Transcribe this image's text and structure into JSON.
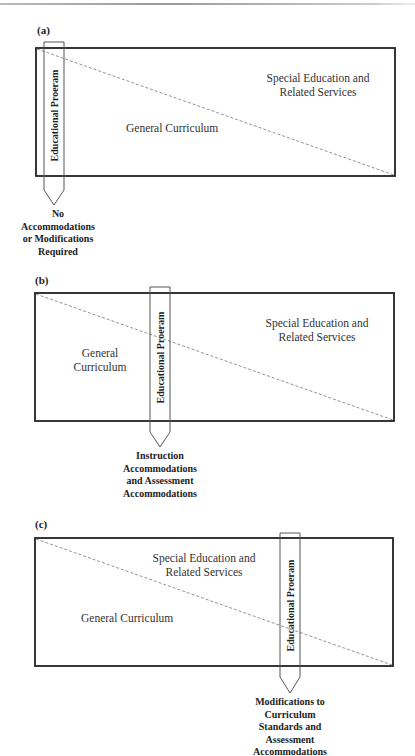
{
  "header": {
    "rule": true
  },
  "panels": [
    {
      "label": "(a)",
      "box": {
        "x": 36,
        "y": 48,
        "w": 359,
        "h": 128
      },
      "pencil": {
        "x": 44,
        "w": 20,
        "top": 42,
        "shaft_end": 190,
        "tip": 205
      },
      "pencil_label": "Educational Proeram",
      "regions": {
        "general": "General Curriculum",
        "special_line1": "Special Education and",
        "special_line2": "Related Services"
      },
      "callout": "No\nAccommodations\nor Modifications\nRequired"
    },
    {
      "label": "(b)",
      "box": {
        "x": 35,
        "y": 293,
        "w": 359,
        "h": 128
      },
      "pencil": {
        "x": 150,
        "w": 20,
        "top": 287,
        "shaft_end": 432,
        "tip": 447
      },
      "pencil_label": "Educational Proeram",
      "regions": {
        "general_line1": "General",
        "general_line2": "Curriculum",
        "special_line1": "Special Education and",
        "special_line2": "Related Services"
      },
      "callout": "Instruction\nAccommodations\nand Assessment\nAccommodations"
    },
    {
      "label": "(c)",
      "box": {
        "x": 35,
        "y": 538,
        "w": 358,
        "h": 128
      },
      "pencil": {
        "x": 280,
        "w": 20,
        "top": 533,
        "shaft_end": 677,
        "tip": 693
      },
      "pencil_label": "Educational  Proeram",
      "regions": {
        "general": "General Curriculum",
        "special_line1": "Special Education and",
        "special_line2": "Related Services"
      },
      "callout": "Modifications to\nCurriculum\nStandards and\nAssessment\nAccommodations"
    }
  ],
  "colors": {
    "box_stroke": "#222222",
    "pencil_stroke": "#555555",
    "dash_line": "#777777",
    "text": "#333333"
  }
}
